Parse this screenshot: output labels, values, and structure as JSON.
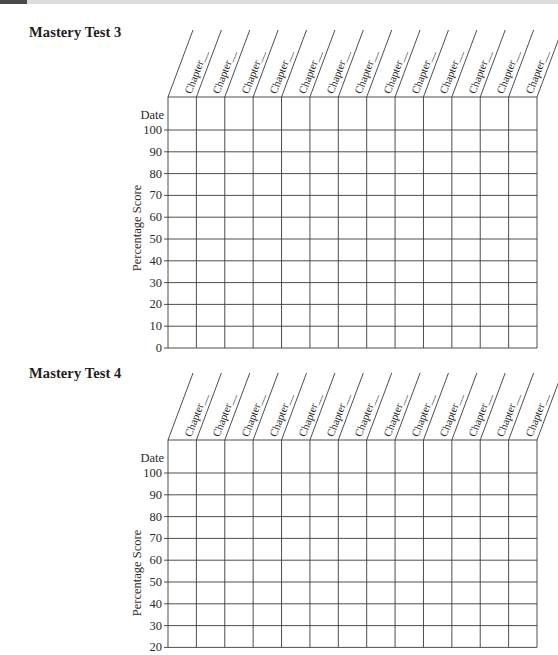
{
  "page": {
    "topbar": {
      "tab_color": "#4a4a4a",
      "bar_color": "#dcdcdc"
    }
  },
  "charts": [
    {
      "title": "Mastery Test 3",
      "column_header": "Chapter__",
      "columns": 13,
      "date_label": "Date",
      "y_axis_label": "Percentage Score",
      "y_ticks": [
        "100",
        "90",
        "80",
        "70",
        "60",
        "50",
        "40",
        "30",
        "20",
        "10",
        "0"
      ]
    },
    {
      "title": "Mastery Test 4",
      "column_header": "Chapter__",
      "columns": 13,
      "date_label": "Date",
      "y_axis_label": "Percentage Score",
      "y_ticks": [
        "100",
        "90",
        "80",
        "70",
        "60",
        "50",
        "40",
        "30",
        "20"
      ]
    }
  ],
  "chart_data": [
    {
      "type": "table",
      "title": "Mastery Test 3",
      "categories": [
        "Chapter__",
        "Chapter__",
        "Chapter__",
        "Chapter__",
        "Chapter__",
        "Chapter__",
        "Chapter__",
        "Chapter__",
        "Chapter__",
        "Chapter__",
        "Chapter__",
        "Chapter__",
        "Chapter__"
      ],
      "xlabel": "Chapter",
      "ylabel": "Percentage Score",
      "row_labels": [
        "Date",
        "100",
        "90",
        "80",
        "70",
        "60",
        "50",
        "40",
        "30",
        "20",
        "10",
        "0"
      ],
      "ylim": [
        0,
        100
      ],
      "values": [],
      "grid": true
    },
    {
      "type": "table",
      "title": "Mastery Test 4",
      "categories": [
        "Chapter__",
        "Chapter__",
        "Chapter__",
        "Chapter__",
        "Chapter__",
        "Chapter__",
        "Chapter__",
        "Chapter__",
        "Chapter__",
        "Chapter__",
        "Chapter__",
        "Chapter__",
        "Chapter__"
      ],
      "xlabel": "Chapter",
      "ylabel": "Percentage Score",
      "row_labels": [
        "Date",
        "100",
        "90",
        "80",
        "70",
        "60",
        "50",
        "40",
        "30",
        "20"
      ],
      "ylim": [
        20,
        100
      ],
      "values": [],
      "grid": true
    }
  ]
}
